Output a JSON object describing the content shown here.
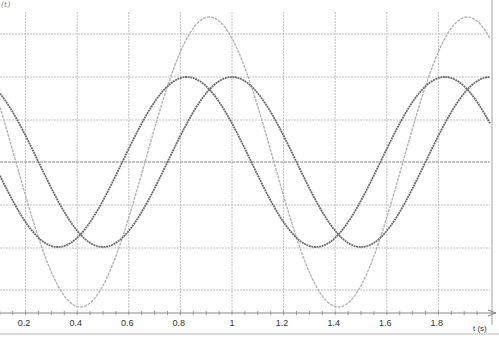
{
  "chart_data": {
    "type": "line",
    "title": "",
    "xlabel": "t (s)",
    "ylabel": "(t)",
    "xlim": [
      0.1,
      1.99
    ],
    "ylim": [
      -1.75,
      1.75
    ],
    "x_ticks": [
      "0.2",
      "0.4",
      "0.6",
      "0.8",
      "1",
      "1.2",
      "1.4",
      "1.6",
      "1.8"
    ],
    "grid": true,
    "legend": "none",
    "series": [
      {
        "name": "wave-1",
        "color": "#6e6e6e",
        "amplitude": 1.0,
        "period": 1.0,
        "peak_times": [
          0.825,
          1.825
        ],
        "trough_times": [
          0.325,
          1.325
        ]
      },
      {
        "name": "wave-2",
        "color": "#6e6e6e",
        "amplitude": 1.0,
        "period": 1.0,
        "peak_times": [
          1.0,
          2.0
        ],
        "trough_times": [
          0.5,
          1.5
        ]
      },
      {
        "name": "sum",
        "color": "#b4b4b4",
        "amplitude": 1.7,
        "period": 1.0,
        "peak_times": [
          0.91,
          1.91
        ],
        "trough_times": [
          0.41,
          1.41
        ]
      }
    ]
  },
  "axis": {
    "x_label": "t (s)",
    "y_label": "(t)"
  }
}
